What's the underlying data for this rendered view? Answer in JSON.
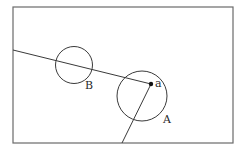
{
  "diagram": {
    "frame": {
      "x": 13,
      "y": 7,
      "width": 220,
      "height": 136,
      "stroke": "#6a6a6a"
    },
    "circles": [
      {
        "id": "A",
        "label": "A",
        "cx": 142,
        "cy": 96,
        "r": 25,
        "label_x": 163,
        "label_y": 123
      },
      {
        "id": "B",
        "label": "B",
        "cx": 74,
        "cy": 65,
        "r": 18.5,
        "label_x": 85,
        "label_y": 89
      }
    ],
    "point": {
      "label": "a",
      "x": 151,
      "y": 84,
      "label_x": 155,
      "label_y": 87
    },
    "lines": [
      {
        "id": "ray-left",
        "x1": 151,
        "y1": 84,
        "x2": 13,
        "y2": 50
      },
      {
        "id": "ray-down",
        "x1": 151,
        "y1": 84,
        "x2": 122,
        "y2": 143
      }
    ],
    "stroke_color": "#3a3a3a"
  }
}
